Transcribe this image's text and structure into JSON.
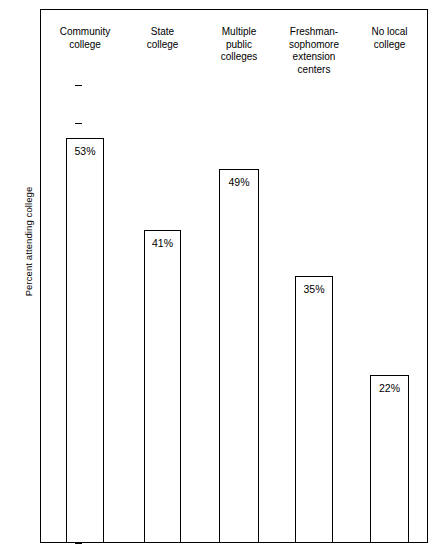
{
  "chart_data": {
    "type": "bar",
    "title": "",
    "xlabel": "",
    "ylabel": "Percent attending college",
    "categories": [
      "Community\ncollege",
      "State\ncollege",
      "Multiple\npublic\ncolleges",
      "Freshman-\nsophomore\nextension\ncenters",
      "No local\ncollege"
    ],
    "values": [
      53,
      41,
      49,
      35,
      22
    ],
    "value_labels": [
      "53%",
      "41%",
      "49%",
      "35%",
      "22%"
    ],
    "ylim": [
      0,
      62
    ],
    "yticks": [
      0,
      5,
      10,
      15,
      20,
      25,
      30,
      35,
      40,
      45,
      50,
      55,
      60
    ],
    "ytick_labels": [
      "0",
      "5",
      "10",
      "15",
      "20",
      "25",
      "30",
      "35",
      "40",
      "45",
      "50",
      "55",
      "60"
    ],
    "grid": false,
    "legend": false,
    "bar_fill_color": "#ffffff",
    "bar_edge_color": "#000000",
    "axis_color": "#000000",
    "background_color": "#ffffff"
  }
}
